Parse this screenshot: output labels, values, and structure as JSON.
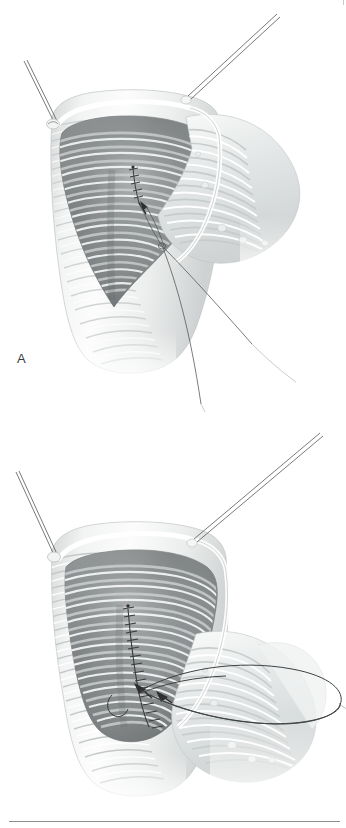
{
  "figure": {
    "background_color": "#ffffff",
    "ink_color": "#3b3b3b",
    "rule_color": "#8d8d8d",
    "width": 346,
    "height": 828,
    "panel_count": 2
  },
  "panels": [
    {
      "id": "A",
      "label": "A",
      "caption_text": "A",
      "description": "Opened bowel segment held by two traction sutures with the first anchoring stitch placed at the apex of the enterotomy",
      "elements": {
        "traction_suture_left": "traction-suture",
        "traction_suture_right": "traction-suture",
        "anchor_stitch": "anchor-stitch",
        "free_suture_tails": "suture-tail",
        "bowel_wall": "bowel-wall",
        "mucosal_folds": "mucosal-folds",
        "serosal_loop": "bowel-loop"
      }
    },
    {
      "id": "B",
      "label": "B",
      "caption_text": "B",
      "description": "Completed running suture line closing the enterotomy with the needle and looped thread carried to the right",
      "elements": {
        "traction_suture_left": "traction-suture",
        "traction_suture_right": "traction-suture",
        "running_suture_line": "running-suture",
        "suture_loop": "suture-loop",
        "bowel_wall": "bowel-wall",
        "mucosal_folds": "mucosal-folds",
        "serosal_loop": "bowel-loop"
      }
    }
  ],
  "labels": {
    "panel_a": "A",
    "panel_b": "B"
  },
  "palette": {
    "paper": "#ffffff",
    "lumen_dark": "#6f7273",
    "lumen_mid": "#9a9d9e",
    "tissue_light": "#e8eaea",
    "tissue_mid": "#c7caca",
    "highlight": "#fdfdfd",
    "suture": "#3a3a3a",
    "label": "#3b3b3b",
    "rule": "#8d8d8d"
  }
}
